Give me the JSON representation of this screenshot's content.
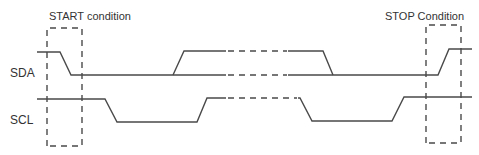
{
  "diagram": {
    "annotations": {
      "start": "START condition",
      "stop": "STOP Condition"
    },
    "signals": [
      {
        "name": "SDA"
      },
      {
        "name": "SCL"
      }
    ],
    "colors": {
      "line": "#4a4a4a",
      "text": "#333333",
      "background": "#ffffff"
    }
  }
}
